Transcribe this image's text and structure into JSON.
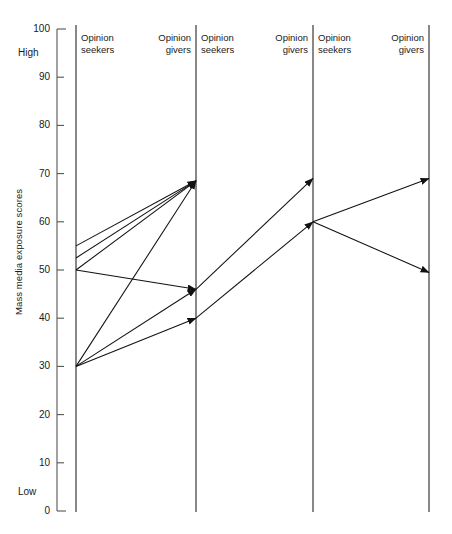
{
  "chart": {
    "ylabel": "Mass media exposure scores",
    "high_label": "High",
    "low_label": "Low",
    "tick_labels": [
      "100",
      "90",
      "80",
      "70",
      "60",
      "50",
      "40",
      "30",
      "20",
      "10",
      "0"
    ],
    "columns": [
      {
        "line1": "Opinion",
        "line2": "seekers",
        "align": "left"
      },
      {
        "line1": "Opinion",
        "line2": "givers",
        "align": "right"
      },
      {
        "line1": "Opinion",
        "line2": "seekers",
        "align": "left"
      },
      {
        "line1": "Opinion",
        "line2": "givers",
        "align": "right"
      },
      {
        "line1": "Opinion",
        "line2": "seekers",
        "align": "left"
      },
      {
        "line1": "Opinion",
        "line2": "givers",
        "align": "right"
      }
    ]
  },
  "chart_data": {
    "type": "line",
    "title": "",
    "subtitle": "",
    "xlabel": "",
    "ylabel": "Mass media exposure scores",
    "ylim": [
      0,
      100
    ],
    "yticks": [
      0,
      10,
      20,
      30,
      40,
      50,
      60,
      70,
      80,
      90,
      100
    ],
    "grid": false,
    "legend": "none",
    "axis_annotations": {
      "top": "High",
      "bottom": "Low"
    },
    "stage_labels": [
      "Opinion seekers",
      "Opinion givers",
      "Opinion seekers",
      "Opinion givers",
      "Opinion seekers",
      "Opinion givers"
    ],
    "stage_axes": [
      {
        "name": "axis-1",
        "x_px": 76
      },
      {
        "name": "axis-2",
        "x_px": 196
      },
      {
        "name": "axis-3",
        "x_px": 313
      },
      {
        "name": "axis-4",
        "x_px": 429
      }
    ],
    "flows": [
      {
        "from_axis": 1,
        "from_value": 55,
        "to_axis": 2,
        "to_value": 68.5,
        "arrow": true
      },
      {
        "from_axis": 1,
        "from_value": 52.5,
        "to_axis": 2,
        "to_value": 68.5,
        "arrow": true
      },
      {
        "from_axis": 1,
        "from_value": 50,
        "to_axis": 2,
        "to_value": 68.5,
        "arrow": true
      },
      {
        "from_axis": 1,
        "from_value": 50,
        "to_axis": 2,
        "to_value": 46,
        "arrow": true
      },
      {
        "from_axis": 1,
        "from_value": 30,
        "to_axis": 2,
        "to_value": 68.5,
        "arrow": true
      },
      {
        "from_axis": 1,
        "from_value": 30,
        "to_axis": 2,
        "to_value": 46,
        "arrow": true
      },
      {
        "from_axis": 1,
        "from_value": 30,
        "to_axis": 2,
        "to_value": 40,
        "arrow": true
      },
      {
        "from_axis": 2,
        "from_value": 46,
        "to_axis": 3,
        "to_value": 69,
        "arrow": true
      },
      {
        "from_axis": 2,
        "from_value": 40,
        "to_axis": 3,
        "to_value": 60,
        "arrow": true
      },
      {
        "from_axis": 3,
        "from_value": 60,
        "to_axis": 4,
        "to_value": 69,
        "arrow": true
      },
      {
        "from_axis": 3,
        "from_value": 60,
        "to_axis": 4,
        "to_value": 49.5,
        "arrow": true
      }
    ],
    "colors": {
      "line": "#111111",
      "axis": "#555555",
      "text": "#1a1a1a",
      "background": "#ffffff"
    }
  }
}
